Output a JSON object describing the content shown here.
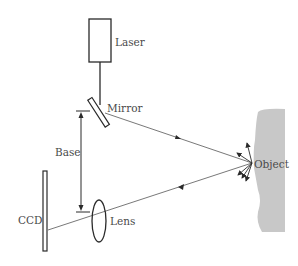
{
  "diagram": {
    "type": "laser triangulation",
    "labels": {
      "laser": "Laser",
      "mirror": "Mirror",
      "base": "Base",
      "ccd": "CCD",
      "lens": "Lens",
      "object": "Object"
    },
    "colors": {
      "line": "#2a2a2a",
      "object_fill": "#c8c8c8",
      "text": "#4a4a4a"
    }
  }
}
